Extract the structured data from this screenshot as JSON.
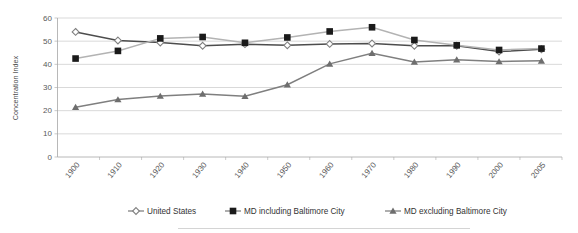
{
  "chart_data": {
    "type": "line",
    "title": "",
    "xlabel": "",
    "ylabel": "Concentration Index",
    "categories": [
      "1900",
      "1910",
      "1920",
      "1930",
      "1940",
      "1950",
      "1960",
      "1970",
      "1980",
      "1990",
      "2000",
      "2005"
    ],
    "ylim": [
      0,
      60
    ],
    "yticks": [
      0,
      10,
      20,
      30,
      40,
      50,
      60
    ],
    "grid": true,
    "legend_position": "bottom",
    "series": [
      {
        "name": "United States",
        "marker": "diamond-open",
        "color": "#4d4d4d",
        "values": [
          54.0,
          50.3,
          49.4,
          48.0,
          48.7,
          48.2,
          48.8,
          49.0,
          48.0,
          48.0,
          45.5,
          46.5
        ]
      },
      {
        "name": "MD including Baltimore City",
        "marker": "square-filled",
        "color": "#b3b3b3",
        "values": [
          42.5,
          45.8,
          51.2,
          51.8,
          49.3,
          51.6,
          54.2,
          56.0,
          50.5,
          48.2,
          46.2,
          46.8
        ]
      },
      {
        "name": "MD excluding Baltimore City",
        "marker": "triangle-filled",
        "color": "#7f7f7f",
        "values": [
          21.5,
          24.8,
          26.3,
          27.2,
          26.2,
          31.2,
          40.2,
          44.8,
          41.0,
          42.0,
          41.2,
          41.5
        ]
      }
    ]
  },
  "legend": {
    "items": [
      {
        "label": "United States",
        "marker_name": "diamond-open-marker"
      },
      {
        "label": "MD including Baltimore City",
        "marker_name": "square-filled-marker"
      },
      {
        "label": "MD excluding Baltimore City",
        "marker_name": "triangle-filled-marker"
      }
    ]
  }
}
